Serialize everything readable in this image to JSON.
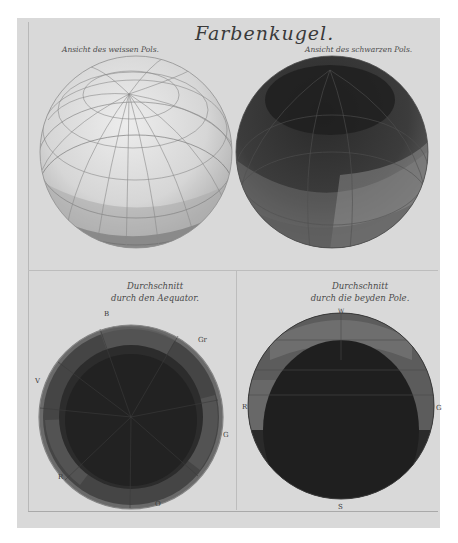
{
  "plate": {
    "title": "Farbenkugel.",
    "paper_color": "#d9d9d9"
  },
  "panels": [
    {
      "id": "white-pole-view",
      "caption": "Ansicht des weissen Pols.",
      "type": "sphere"
    },
    {
      "id": "black-pole-view",
      "caption": "Ansicht des schwarzen Pols.",
      "type": "sphere"
    },
    {
      "id": "equator-section",
      "caption_line1": "Durchschnitt",
      "caption_line2": "durch den Aequator.",
      "type": "cross-section",
      "labels": {
        "top": "B",
        "top_right": "Gr",
        "left": "V",
        "right": "G",
        "bottom_left": "R",
        "bottom": "O"
      }
    },
    {
      "id": "poles-section",
      "caption_line1": "Durchschnitt",
      "caption_line2": "durch die beyden Pole.",
      "type": "cross-section",
      "labels": {
        "top": "W",
        "left": "R",
        "right": "G",
        "bottom": "S"
      }
    }
  ]
}
